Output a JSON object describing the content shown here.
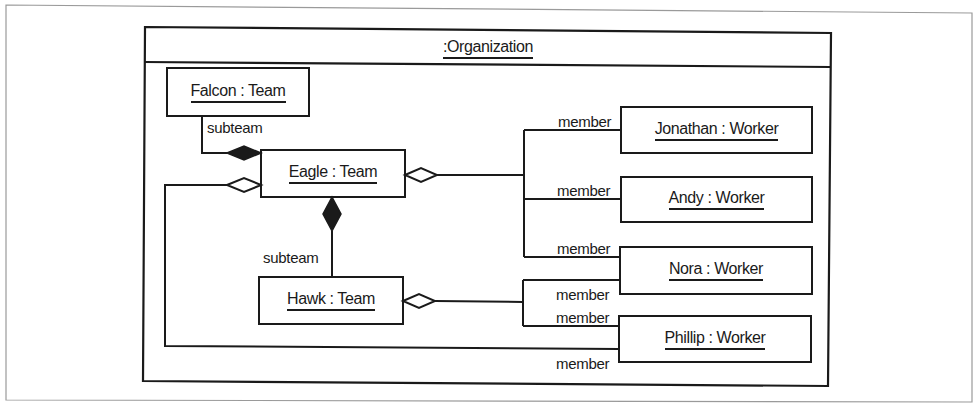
{
  "diagram": {
    "type": "UML object diagram",
    "frame": {
      "title": ":Organization"
    },
    "objects": [
      {
        "id": "falcon",
        "label": "Falcon : Team"
      },
      {
        "id": "eagle",
        "label": "Eagle : Team"
      },
      {
        "id": "hawk",
        "label": "Hawk : Team"
      },
      {
        "id": "jonathan",
        "label": "Jonathan : Worker"
      },
      {
        "id": "andy",
        "label": "Andy : Worker"
      },
      {
        "id": "nora",
        "label": "Nora : Worker"
      },
      {
        "id": "phillip",
        "label": "Phillip : Worker"
      }
    ],
    "links": [
      {
        "from": "eagle",
        "to": "falcon",
        "kind": "composition",
        "role": "subteam"
      },
      {
        "from": "eagle",
        "to": "hawk",
        "kind": "composition",
        "role": "subteam"
      },
      {
        "from": "eagle",
        "to": "jonathan",
        "kind": "aggregation",
        "role": "member"
      },
      {
        "from": "eagle",
        "to": "andy",
        "kind": "aggregation",
        "role": "member"
      },
      {
        "from": "eagle",
        "to": "nora",
        "kind": "aggregation",
        "role": "member"
      },
      {
        "from": "eagle",
        "to": "phillip",
        "kind": "aggregation",
        "role": "member"
      },
      {
        "from": "hawk",
        "to": "nora",
        "kind": "aggregation",
        "role": "member"
      },
      {
        "from": "hawk",
        "to": "phillip",
        "kind": "aggregation",
        "role": "member"
      }
    ],
    "role_labels": {
      "subteam_falcon": "subteam",
      "subteam_hawk": "subteam",
      "member_jonathan": "member",
      "member_andy": "member",
      "member_nora_eagle": "member",
      "member_nora_hawk": "member",
      "member_phillip_hawk": "member",
      "member_phillip_eagle": "member"
    },
    "colors": {
      "ink": "#1a1a1a",
      "page_border": "#9a9a9a",
      "background": "#ffffff"
    }
  }
}
